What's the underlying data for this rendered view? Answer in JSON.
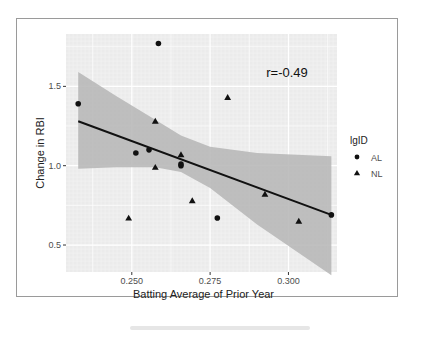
{
  "chart_data": {
    "type": "scatter",
    "title": "",
    "xlabel": "Batting Average of Prior Year",
    "ylabel": "Change in RBI",
    "xlim": [
      0.229,
      0.3155
    ],
    "ylim": [
      0.33,
      1.83
    ],
    "xticks": [
      0.25,
      0.275,
      0.3
    ],
    "xtick_labels": [
      "0.250",
      "0.275",
      "0.300"
    ],
    "yticks": [
      0.5,
      1.0,
      1.5
    ],
    "ytick_labels": [
      "0.5",
      "1.0",
      "1.5"
    ],
    "grid": true,
    "annotation": "r=-0.49",
    "legend": {
      "title": "lgID",
      "position": "right",
      "entries": [
        {
          "label": "AL",
          "shape": "circle"
        },
        {
          "label": "NL",
          "shape": "triangle"
        }
      ]
    },
    "series": [
      {
        "name": "AL",
        "shape": "circle",
        "points": [
          {
            "x": 0.2329,
            "y": 1.39
          },
          {
            "x": 0.2585,
            "y": 1.77
          },
          {
            "x": 0.2513,
            "y": 1.08
          },
          {
            "x": 0.2555,
            "y": 1.1
          },
          {
            "x": 0.2657,
            "y": 1.01
          },
          {
            "x": 0.2657,
            "y": 1.0
          },
          {
            "x": 0.2773,
            "y": 0.67
          },
          {
            "x": 0.3137,
            "y": 0.69
          }
        ]
      },
      {
        "name": "NL",
        "shape": "triangle",
        "points": [
          {
            "x": 0.2575,
            "y": 1.28
          },
          {
            "x": 0.2575,
            "y": 0.99
          },
          {
            "x": 0.2657,
            "y": 1.07
          },
          {
            "x": 0.2693,
            "y": 0.78
          },
          {
            "x": 0.2806,
            "y": 1.43
          },
          {
            "x": 0.249,
            "y": 0.67
          },
          {
            "x": 0.2925,
            "y": 0.82
          },
          {
            "x": 0.3033,
            "y": 0.65
          }
        ]
      }
    ],
    "regression": {
      "method": "lm",
      "x_start": 0.2329,
      "y_start": 1.28,
      "x_end": 0.3137,
      "y_end": 0.69,
      "ci_band": {
        "upper": [
          [
            0.2329,
            1.59
          ],
          [
            0.245,
            1.44
          ],
          [
            0.2575,
            1.29
          ],
          [
            0.2657,
            1.19
          ],
          [
            0.275,
            1.12
          ],
          [
            0.29,
            1.08
          ],
          [
            0.3137,
            1.06
          ]
        ],
        "lower": [
          [
            0.2329,
            0.98
          ],
          [
            0.245,
            0.99
          ],
          [
            0.2575,
            0.99
          ],
          [
            0.2657,
            0.96
          ],
          [
            0.275,
            0.86
          ],
          [
            0.29,
            0.63
          ],
          [
            0.3137,
            0.31
          ]
        ]
      }
    }
  },
  "colors": {
    "panel_bg": "#ebebeb",
    "grid": "#ffffff",
    "ribbon": "#b5b5b5",
    "points": "#111111",
    "line": "#111111",
    "text": "#4d4d4d"
  }
}
